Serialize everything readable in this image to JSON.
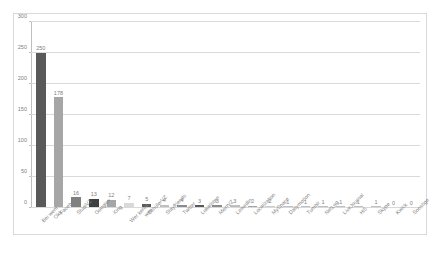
{
  "chart_data": {
    "type": "bar",
    "title": "",
    "subtitle": "",
    "xlabel": "",
    "ylabel": "",
    "ylim": [
      0,
      300
    ],
    "yticks": [
      0,
      50,
      100,
      150,
      200,
      250,
      300
    ],
    "grid": true,
    "legend": false,
    "legend_position": "none",
    "categories": [
      "Bei wem Okk",
      "Facebook",
      "StudiVZ",
      "Google+",
      "Xing",
      "Wer kennt wen",
      "SchülerVZ",
      "Stayfriends",
      "Twitter",
      "Lokalisten",
      "MeinVZ",
      "LinkedIn",
      "Localization",
      "MySpace",
      "Dailymotion",
      "Tumblr",
      "NetLog",
      "LiveJournal",
      "Hi5",
      "Skype",
      "Kwick",
      "Sonstige"
    ],
    "values": [
      250,
      178,
      16,
      13,
      12,
      7,
      5,
      4,
      4,
      3,
      3,
      3,
      2,
      2,
      1,
      1,
      1,
      1,
      1,
      1,
      0,
      0
    ],
    "bar_colors": [
      "#595959",
      "#a6a6a6",
      "#808080",
      "#404040",
      "#a6a6a6",
      "#d9d9d9",
      "#595959",
      "#bfbfbf",
      "#8c8c8c",
      "#595959",
      "#8c8c8c",
      "#bfbfbf",
      "#a6a6a6",
      "#cccccc",
      "#bfbfbf",
      "#bfbfbf",
      "#bfbfbf",
      "#bfbfbf",
      "#bfbfbf",
      "#bfbfbf",
      "#d9d9d9",
      "#d9d9d9"
    ],
    "value_label_color": "#808080",
    "axis_color": "#bfbfbf",
    "gridline_color": "#d9d9d9",
    "frame_color": "#d9d9d9",
    "background": "#ffffff"
  }
}
